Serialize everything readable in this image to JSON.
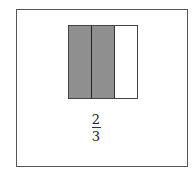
{
  "diagram": {
    "type": "fraction-model",
    "parts_total": 3,
    "parts_shaded": 2,
    "shade_color": "#8f8f8f",
    "parts": [
      {
        "index": 1,
        "shaded": true
      },
      {
        "index": 2,
        "shaded": true
      },
      {
        "index": 3,
        "shaded": false
      }
    ],
    "fraction": {
      "numerator": "2",
      "denominator": "3"
    }
  }
}
